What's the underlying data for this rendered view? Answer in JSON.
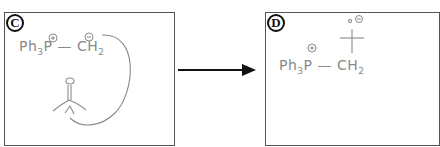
{
  "panels": [
    {
      "label": "C",
      "ylide": {
        "phosphorus": "Ph",
        "subscript": "3",
        "p": "P",
        "bond": "—",
        "carbon": "CH",
        "carbon_sub": "2",
        "p_charge": "+",
        "c_charge": "−"
      },
      "carbonyl": {
        "oxygen": "O"
      },
      "annotation": "curved arrow from CH2 lone pair to carbonyl carbon"
    },
    {
      "label": "D",
      "ylide": {
        "phosphorus": "Ph",
        "subscript": "3",
        "p": "P",
        "bond": "—",
        "carbon": "CH",
        "carbon_sub": "2",
        "p_charge": "+"
      },
      "alkoxide": {
        "oxygen_charge": "−"
      }
    }
  ],
  "reaction_arrow": {
    "direction": "right",
    "color": "#111111"
  },
  "colors": {
    "ink": "#8a8a8a",
    "border": "#555555",
    "label": "#111111"
  }
}
